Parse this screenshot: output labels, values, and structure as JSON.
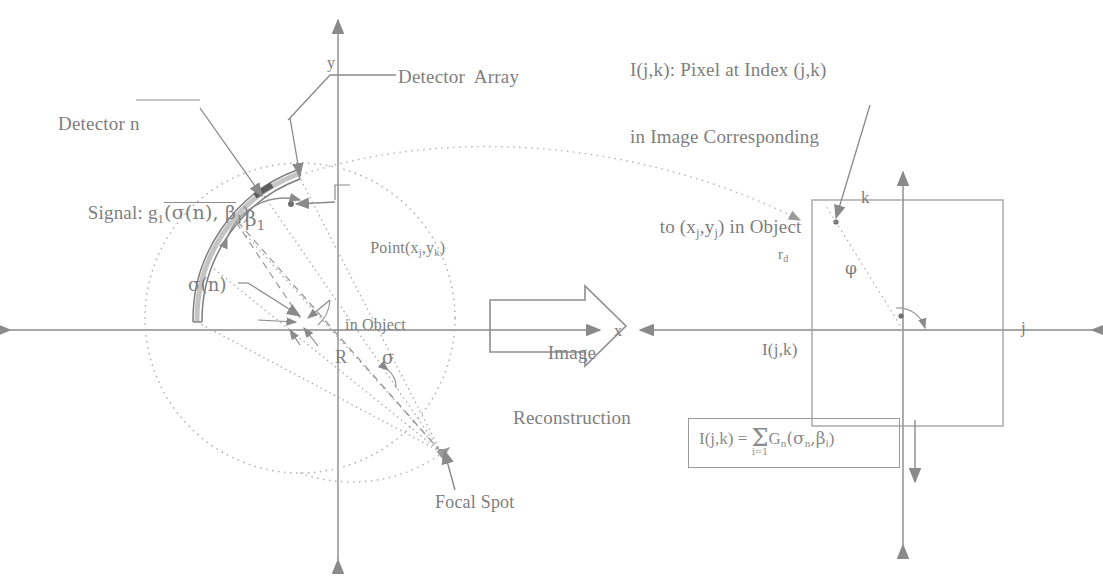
{
  "figure": {
    "type": "diagram"
  },
  "left_panel": {
    "detector_signal_label": {
      "line1": "Detector n",
      "line2_prefix": "Signal: g",
      "line2_sub": "1",
      "line2_rest": "(σ(n), β",
      "line2_sub2": "1",
      "line2_end": ")"
    },
    "detector_array_label": "Detector  Array",
    "point_label": {
      "line1_prefix": "Point(x",
      "line1_sub1": "j",
      "line1_mid": ",y",
      "line1_sub2": "k",
      "line1_end": ")",
      "line2": "in Object"
    },
    "beta_label": "β",
    "beta_sub": "1",
    "sigma_n_label": "σ(n)",
    "radius_label": "R",
    "sigma_label": "σ",
    "focal_spot_label": "Focal Spot",
    "x_axis_label": "x",
    "y_axis_label": "y"
  },
  "center": {
    "arrow_line1": "Image",
    "arrow_line2": "Reconstruction"
  },
  "right_panel": {
    "k_axis_label": "k",
    "j_axis_label": "j",
    "rd_label": "r",
    "rd_sub": "d",
    "phi_label": "φ",
    "image_label": "I(j,k)",
    "equation": {
      "lhs": "I(j,k) =",
      "sum_symbol": "Σ",
      "sum_lower": "i=1",
      "rhs_prefix": "G",
      "rhs_sub1": "n",
      "rhs_mid": "(σ",
      "rhs_sub2": "n",
      "rhs_mid2": ",β",
      "rhs_sub3": "i",
      "rhs_end": ")"
    },
    "pixel_caption": {
      "line1_a": "I(j,k): Pixel at Index (j,k)",
      "line2": "in Image Corresponding",
      "line3_a": "to (x",
      "line3_sub1": "j",
      "line3_b": ",y",
      "line3_sub2": "j",
      "line3_c": ") in Object"
    }
  },
  "colors": {
    "ink": "#8a8a8a",
    "ink_light": "#a8a8a8",
    "background": "#ffffff"
  }
}
